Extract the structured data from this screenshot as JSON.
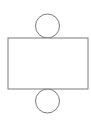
{
  "diagram": {
    "stroke_color": "#7a7a7a",
    "fill_color": "#ffffff",
    "shapes": {
      "top_circle": {
        "cx": 47.5,
        "cy": 26,
        "r": 12
      },
      "rectangle": {
        "x": 8,
        "y": 38,
        "width": 80,
        "height": 51
      },
      "bottom_circle": {
        "cx": 47.5,
        "cy": 101,
        "r": 12
      }
    }
  }
}
